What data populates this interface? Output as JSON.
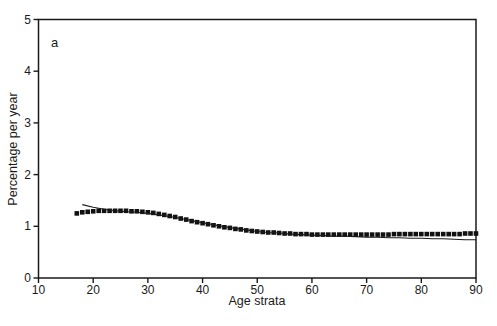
{
  "chart_data": {
    "type": "scatter",
    "panel_label": "a",
    "title": "",
    "xlabel": "Age strata",
    "ylabel": "Percentage per year",
    "xlim": [
      10,
      90
    ],
    "ylim": [
      0,
      5
    ],
    "xticks": [
      10,
      20,
      30,
      40,
      50,
      60,
      70,
      80,
      90
    ],
    "yticks": [
      0,
      1,
      2,
      3,
      4,
      5
    ],
    "grid": false,
    "frame": "box",
    "legend": "none",
    "ink_color": "#1a1a1a",
    "background": "#ffffff",
    "series": [
      {
        "name": "observed-rates",
        "draw": "markers",
        "marker": "square",
        "marker_size": 4.6,
        "color": "#111111",
        "x": [
          17,
          18,
          19,
          20,
          21,
          22,
          23,
          24,
          25,
          26,
          27,
          28,
          29,
          30,
          31,
          32,
          33,
          34,
          35,
          36,
          37,
          38,
          39,
          40,
          41,
          42,
          43,
          44,
          45,
          46,
          47,
          48,
          49,
          50,
          51,
          52,
          53,
          54,
          55,
          56,
          57,
          58,
          59,
          60,
          61,
          62,
          63,
          64,
          65,
          66,
          67,
          68,
          69,
          70,
          71,
          72,
          73,
          74,
          75,
          76,
          77,
          78,
          79,
          80,
          81,
          82,
          83,
          84,
          85,
          86,
          87,
          88,
          89,
          90
        ],
        "y": [
          1.25,
          1.27,
          1.28,
          1.29,
          1.3,
          1.3,
          1.3,
          1.3,
          1.3,
          1.3,
          1.29,
          1.29,
          1.28,
          1.27,
          1.26,
          1.24,
          1.22,
          1.2,
          1.18,
          1.15,
          1.13,
          1.1,
          1.08,
          1.06,
          1.04,
          1.02,
          1.0,
          0.98,
          0.97,
          0.95,
          0.94,
          0.92,
          0.91,
          0.9,
          0.89,
          0.88,
          0.88,
          0.87,
          0.86,
          0.86,
          0.85,
          0.85,
          0.85,
          0.84,
          0.84,
          0.84,
          0.84,
          0.84,
          0.84,
          0.84,
          0.84,
          0.84,
          0.84,
          0.84,
          0.84,
          0.84,
          0.84,
          0.84,
          0.85,
          0.85,
          0.85,
          0.85,
          0.85,
          0.85,
          0.85,
          0.85,
          0.85,
          0.85,
          0.85,
          0.85,
          0.85,
          0.86,
          0.86,
          0.86
        ]
      },
      {
        "name": "fitted-curve",
        "draw": "line",
        "line_width": 1.1,
        "color": "#1a1a1a",
        "x": [
          18,
          20,
          22,
          24,
          26,
          28,
          30,
          32,
          34,
          36,
          38,
          40,
          42,
          44,
          46,
          48,
          50,
          52,
          54,
          56,
          58,
          60,
          62,
          64,
          66,
          68,
          70,
          72,
          74,
          76,
          78,
          80,
          82,
          84,
          86,
          88,
          90
        ],
        "y": [
          1.42,
          1.37,
          1.33,
          1.3,
          1.28,
          1.27,
          1.25,
          1.22,
          1.19,
          1.15,
          1.11,
          1.07,
          1.03,
          0.99,
          0.96,
          0.93,
          0.9,
          0.88,
          0.87,
          0.85,
          0.84,
          0.83,
          0.82,
          0.81,
          0.81,
          0.8,
          0.79,
          0.79,
          0.78,
          0.78,
          0.77,
          0.77,
          0.76,
          0.76,
          0.75,
          0.74,
          0.74
        ]
      }
    ]
  }
}
